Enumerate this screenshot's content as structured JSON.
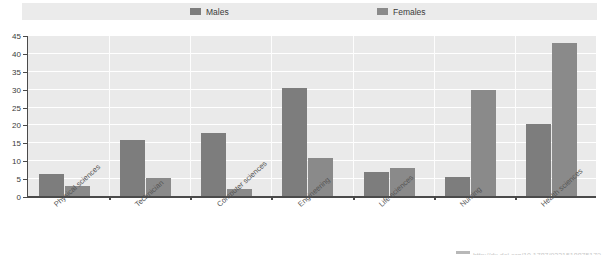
{
  "legend": {
    "items": [
      {
        "label": "Males",
        "color": "#7d7d7d"
      },
      {
        "label": "Females",
        "color": "#8a8a8a"
      }
    ]
  },
  "footer": {
    "text": "http://dx.doi.org/10.1787/923151887517?"
  },
  "chart_data": {
    "type": "bar",
    "title": "",
    "subtitle": "",
    "xlabel": "",
    "ylabel": "",
    "ylim": [
      0,
      45
    ],
    "ytick_step": 5,
    "yticks": [
      0,
      5,
      10,
      15,
      20,
      25,
      30,
      35,
      40,
      45
    ],
    "grid": true,
    "legend_position": "top",
    "categories": [
      "Physical sciences",
      "Technician",
      "Computer sciences",
      "Engineering",
      "Life sciences",
      "Nursing",
      "Health sciences"
    ],
    "series": [
      {
        "name": "Males",
        "color": "#7d7d7d",
        "values": [
          6.5,
          16.0,
          18.0,
          30.5,
          7.0,
          5.5,
          20.5
        ]
      },
      {
        "name": "Females",
        "color": "#8a8a8a",
        "values": [
          3.2,
          5.3,
          2.3,
          11.0,
          8.2,
          30.0,
          43.0
        ]
      }
    ]
  }
}
